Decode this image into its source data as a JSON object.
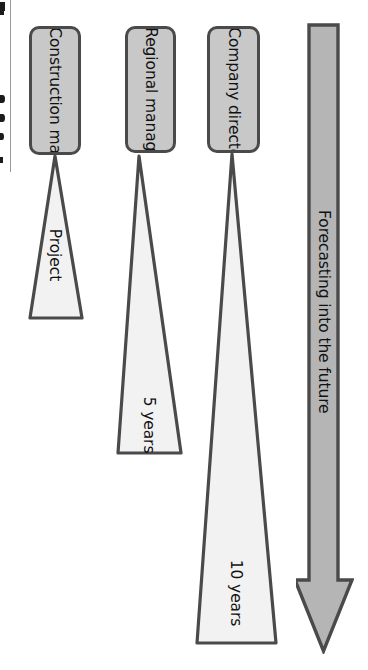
{
  "diagram": {
    "orientation": "rotated-90-clockwise",
    "colors": {
      "box_fill": "#c8c8c8",
      "box_stroke": "#4a4a4a",
      "cone_fill": "#f2f2f2",
      "cone_stroke": "#4a4a4a",
      "arrow_fill": "#b5b5b5",
      "arrow_stroke": "#4a4a4a",
      "text": "#111111"
    },
    "roles": [
      {
        "id": "construction-manager",
        "label": "Construction manager",
        "horizon_label": "Project"
      },
      {
        "id": "regional-manager",
        "label": "Regional manager",
        "horizon_label": "5 years"
      },
      {
        "id": "company-director",
        "label": "Company director",
        "horizon_label": "10 years"
      }
    ],
    "arrow": {
      "label": "Forecasting into the future",
      "direction": "down"
    }
  }
}
